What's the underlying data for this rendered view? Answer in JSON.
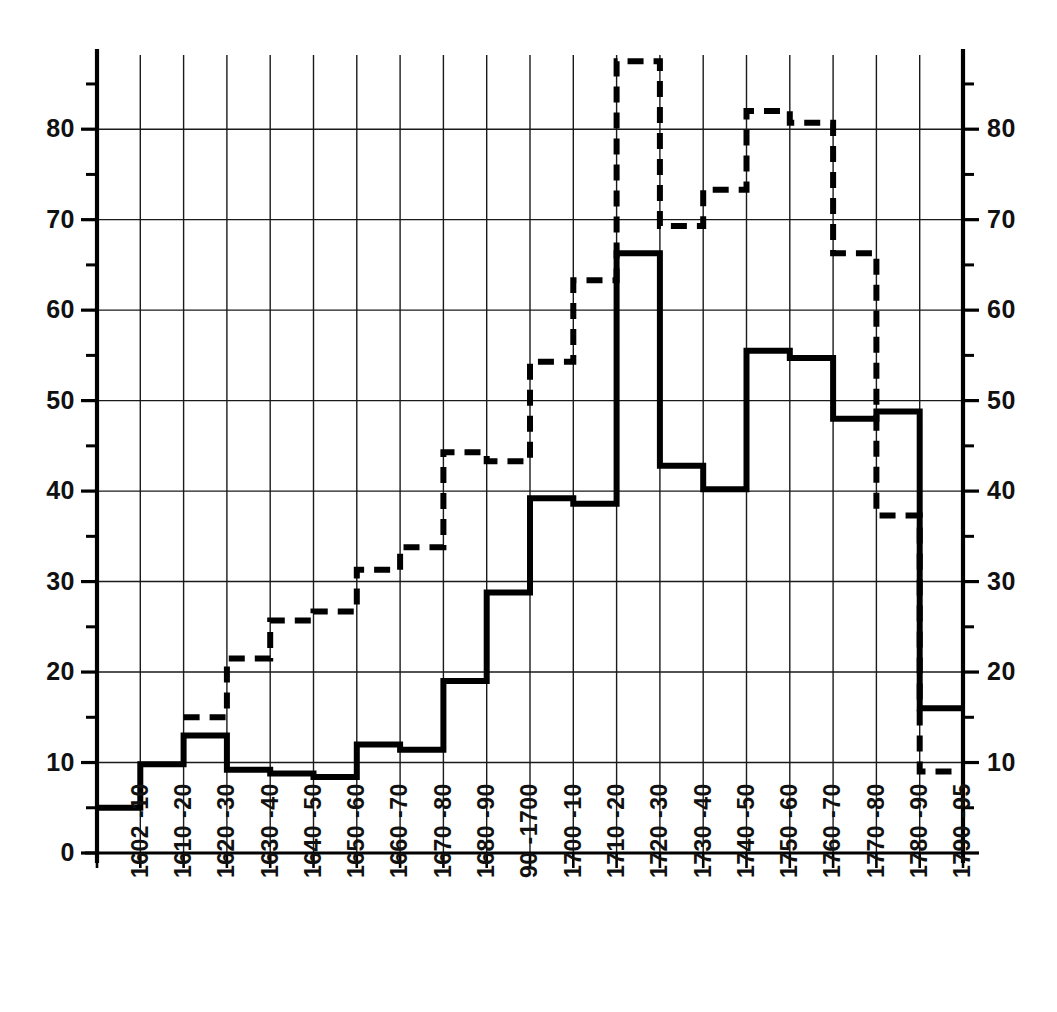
{
  "chart_data": {
    "type": "line",
    "subtype": "step",
    "title": "",
    "subtitle": "",
    "xlabel": "",
    "ylabel": "",
    "grid": true,
    "legend_position": "none",
    "xlim_categories": 20,
    "ylim": [
      0,
      88
    ],
    "y_axis": {
      "min": 0,
      "max": 88,
      "major_step": 10,
      "minor_step": 5,
      "tick_labels_left": [
        "0",
        "10",
        "20",
        "30",
        "40",
        "50",
        "60",
        "70",
        "80"
      ],
      "tick_labels_right": [
        "10",
        "20",
        "30",
        "40",
        "50",
        "60",
        "70",
        "80"
      ],
      "major_ticks": [
        0,
        10,
        20,
        30,
        40,
        50,
        60,
        70,
        80
      ],
      "minor_ticks": [
        5,
        15,
        25,
        35,
        45,
        55,
        65,
        75,
        85
      ]
    },
    "categories": [
      "1602 -10",
      "1610 -20",
      "1620 -30",
      "1630 -40",
      "1640 -50",
      "1650 -60",
      "1660 -70",
      "1670 -80",
      "1680 -90",
      "90 -1700",
      "1700 -10",
      "1710 -20",
      "1720 -30",
      "1730 -40",
      "1740 -50",
      "1750 -60",
      "1760 -70",
      "1770 -80",
      "1780 -90",
      "1790 -95"
    ],
    "series": [
      {
        "name": "solid-series",
        "style": "solid",
        "color": "#000000",
        "line_width": 6,
        "values": [
          5.0,
          9.8,
          13.0,
          9.2,
          8.8,
          8.4,
          12.0,
          11.4,
          19.0,
          28.8,
          39.2,
          38.6,
          66.3,
          42.8,
          40.2,
          55.5,
          54.7,
          48.0,
          48.8,
          16.0
        ]
      },
      {
        "name": "dashed-series",
        "style": "dashed",
        "color": "#000000",
        "line_width": 6,
        "dash_pattern": "16 10",
        "values": [
          null,
          null,
          15.0,
          21.5,
          25.7,
          26.7,
          31.3,
          33.8,
          44.3,
          43.3,
          54.3,
          63.3,
          87.5,
          69.3,
          73.3,
          82.0,
          80.7,
          66.3,
          37.3,
          9.0
        ]
      }
    ]
  },
  "plot_geometry": {
    "left_px": 97,
    "right_px": 963,
    "top_px": 55,
    "bottom_px": 853,
    "value_at_top": 88.2,
    "value_at_bottom": 0
  }
}
